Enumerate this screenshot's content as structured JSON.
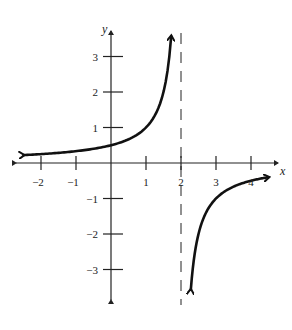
{
  "chart_data": {
    "type": "line",
    "title": "",
    "xlabel": "x",
    "ylabel": "y",
    "xlim": [
      -2.5,
      4.6
    ],
    "ylim": [
      -3.7,
      3.8
    ],
    "x_ticks": [
      -2,
      -1,
      1,
      2,
      3,
      4
    ],
    "x_tick_labels": [
      "−2",
      "−1",
      "1",
      "2",
      "3",
      "4"
    ],
    "y_ticks": [
      3,
      2,
      1,
      -1,
      -2,
      -3
    ],
    "y_tick_labels": [
      "3",
      "2",
      "1",
      "−1",
      "−2",
      "−3"
    ],
    "grid": false,
    "function": "y = -1/(x - 2)",
    "asymptotes": {
      "vertical": 2,
      "horizontal": 0
    },
    "series": [
      {
        "name": "left-branch",
        "x": [
          -2.5,
          -2,
          -1,
          0,
          0.5,
          1,
          1.5,
          1.72
        ],
        "y": [
          0.22,
          0.25,
          0.33,
          0.5,
          0.67,
          1,
          2,
          3.6
        ]
      },
      {
        "name": "right-branch",
        "x": [
          2.28,
          2.5,
          3,
          3.5,
          4,
          4.5
        ],
        "y": [
          -3.6,
          -2,
          -1,
          -0.67,
          -0.5,
          -0.4
        ]
      }
    ]
  }
}
